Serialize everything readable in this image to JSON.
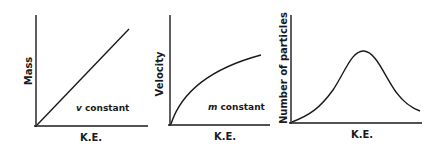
{
  "panels": [
    {
      "ylabel": "Mass",
      "xlabel": "K.E.",
      "annotation_var": "v",
      "annotation_rest": " constant"
    },
    {
      "ylabel": "Velocity",
      "xlabel": "K.E.",
      "annotation_var": "m",
      "annotation_rest": " constant"
    },
    {
      "ylabel": "Number of particles",
      "xlabel": "K.E.",
      "annotation_var": "",
      "annotation_rest": ""
    }
  ],
  "colors": {
    "ink": "#1a1a1a",
    "background": "#ffffff"
  }
}
